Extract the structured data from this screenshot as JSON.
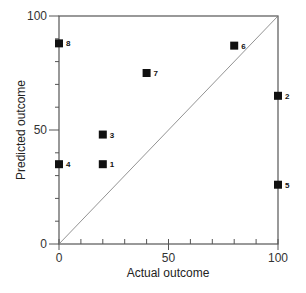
{
  "chart_data": {
    "type": "scatter",
    "title": "",
    "xlabel": "Actual outcome",
    "ylabel": "Predicted outcome",
    "xlim": [
      0,
      100
    ],
    "ylim": [
      0,
      100
    ],
    "x_ticks": [
      0,
      50,
      100
    ],
    "y_ticks": [
      0,
      50,
      100
    ],
    "minor_tick_step": 10,
    "grid": false,
    "legend": null,
    "reference_line": {
      "type": "identity",
      "from": [
        0,
        0
      ],
      "to": [
        100,
        100
      ]
    },
    "points": [
      {
        "label": "1",
        "x": 20,
        "y": 35
      },
      {
        "label": "2",
        "x": 100,
        "y": 65
      },
      {
        "label": "3",
        "x": 20,
        "y": 48
      },
      {
        "label": "4",
        "x": 0,
        "y": 35
      },
      {
        "label": "5",
        "x": 100,
        "y": 26
      },
      {
        "label": "6",
        "x": 80,
        "y": 87
      },
      {
        "label": "7",
        "x": 40,
        "y": 75
      },
      {
        "label": "8",
        "x": 0,
        "y": 88
      }
    ],
    "marker": {
      "shape": "square",
      "color": "#111111"
    }
  }
}
